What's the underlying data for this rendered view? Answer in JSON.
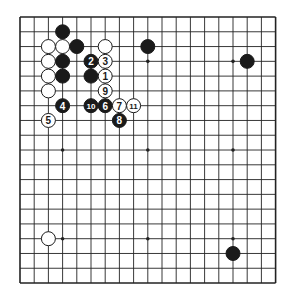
{
  "board": {
    "size": 19,
    "origin_x": 20,
    "origin_y": 17,
    "step_x": 14.2,
    "step_y": 14.78,
    "line_color": "#222222",
    "background": "#ffffff",
    "star_points": [
      [
        3,
        3
      ],
      [
        9,
        3
      ],
      [
        15,
        3
      ],
      [
        3,
        9
      ],
      [
        9,
        9
      ],
      [
        15,
        9
      ],
      [
        3,
        15
      ],
      [
        9,
        15
      ],
      [
        15,
        15
      ]
    ]
  },
  "stones": [
    {
      "col": 3,
      "row": 1,
      "color": "black",
      "label": ""
    },
    {
      "col": 2,
      "row": 2,
      "color": "white",
      "label": ""
    },
    {
      "col": 3,
      "row": 2,
      "color": "white",
      "label": ""
    },
    {
      "col": 4,
      "row": 2,
      "color": "black",
      "label": ""
    },
    {
      "col": 6,
      "row": 2,
      "color": "white",
      "label": ""
    },
    {
      "col": 9,
      "row": 2,
      "color": "black",
      "label": ""
    },
    {
      "col": 2,
      "row": 3,
      "color": "white",
      "label": ""
    },
    {
      "col": 3,
      "row": 3,
      "color": "black",
      "label": ""
    },
    {
      "col": 5,
      "row": 3,
      "color": "black",
      "label": "2"
    },
    {
      "col": 6,
      "row": 3,
      "color": "white",
      "label": "3"
    },
    {
      "col": 16,
      "row": 3,
      "color": "black",
      "label": ""
    },
    {
      "col": 2,
      "row": 4,
      "color": "white",
      "label": ""
    },
    {
      "col": 3,
      "row": 4,
      "color": "black",
      "label": ""
    },
    {
      "col": 5,
      "row": 4,
      "color": "black",
      "label": ""
    },
    {
      "col": 6,
      "row": 4,
      "color": "white",
      "label": "1"
    },
    {
      "col": 2,
      "row": 5,
      "color": "white",
      "label": ""
    },
    {
      "col": 6,
      "row": 5,
      "color": "white",
      "label": "9"
    },
    {
      "col": 3,
      "row": 6,
      "color": "black",
      "label": "4"
    },
    {
      "col": 5,
      "row": 6,
      "color": "black",
      "label": "10"
    },
    {
      "col": 6,
      "row": 6,
      "color": "black",
      "label": "6"
    },
    {
      "col": 7,
      "row": 6,
      "color": "white",
      "label": "7"
    },
    {
      "col": 8,
      "row": 6,
      "color": "white",
      "label": "11"
    },
    {
      "col": 2,
      "row": 7,
      "color": "white",
      "label": "5"
    },
    {
      "col": 7,
      "row": 7,
      "color": "black",
      "label": "8"
    },
    {
      "col": 2,
      "row": 15,
      "color": "white",
      "label": ""
    },
    {
      "col": 15,
      "row": 16,
      "color": "black",
      "label": ""
    }
  ]
}
